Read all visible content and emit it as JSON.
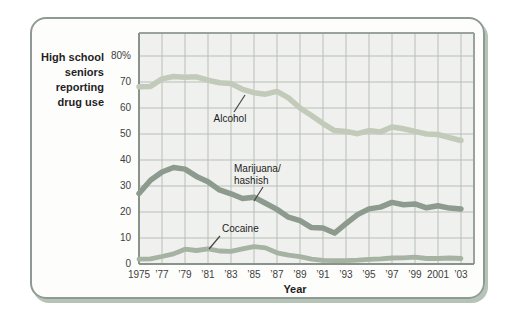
{
  "colors": {
    "card-border": "#8f9a93",
    "shadow": "#b6c3b7",
    "plot-bg": "#f0f1ee",
    "grid": "#b7bfb6",
    "frame": "#9aa39b",
    "axis": "#8a938b",
    "text": "#1f1f1f",
    "text-muted": "#3d3d3d",
    "callout": "#444444"
  },
  "chart_data": {
    "type": "line",
    "title": "High school seniors reporting drug use",
    "title_lines": [
      "High school",
      "seniors",
      "reporting",
      "drug use"
    ],
    "xlabel": "Year",
    "ylabel": "High school seniors reporting drug use",
    "grid": true,
    "legend": "inline annotations with leader lines",
    "xlim": [
      1975,
      2004.2
    ],
    "ylim": [
      0,
      88.8
    ],
    "x": [
      1975,
      1976,
      1977,
      1978,
      1979,
      1980,
      1981,
      1982,
      1983,
      1984,
      1985,
      1986,
      1987,
      1988,
      1989,
      1990,
      1991,
      1992,
      1993,
      1994,
      1995,
      1996,
      1997,
      1998,
      1999,
      2000,
      2001,
      2002,
      2003
    ],
    "x_tick_years": [
      1975,
      1977,
      1979,
      1981,
      1983,
      1985,
      1987,
      1989,
      1991,
      1993,
      1995,
      1997,
      1999,
      2001,
      2003
    ],
    "x_tick_labels": [
      "1975",
      "’77",
      "’79",
      "’81",
      "’83",
      "’85",
      "’87",
      "’89",
      "’91",
      "’93",
      "’95",
      "’97",
      "’99",
      "2001",
      "’03"
    ],
    "y_ticks": [
      0,
      10,
      20,
      30,
      40,
      50,
      60,
      70,
      80
    ],
    "y_tick_labels": [
      "0",
      "10",
      "20",
      "30",
      "40",
      "50",
      "60",
      "70",
      "80%"
    ],
    "series": [
      {
        "name": "Alcohol",
        "color": "#c2cbba",
        "values": [
          68.2,
          68.3,
          71.2,
          72.1,
          71.8,
          72.0,
          70.7,
          69.7,
          69.4,
          67.2,
          65.9,
          65.3,
          66.4,
          63.9,
          60.0,
          57.1,
          54.0,
          51.3,
          51.0,
          50.1,
          51.3,
          50.8,
          52.7,
          52.0,
          51.0,
          50.0,
          49.8,
          48.6,
          47.5
        ]
      },
      {
        "name": "Marijuana/hashish",
        "color": "#8d9a8e",
        "values": [
          27.1,
          32.2,
          35.4,
          37.1,
          36.5,
          33.7,
          31.6,
          28.5,
          27.0,
          25.2,
          25.7,
          23.4,
          21.0,
          18.0,
          16.7,
          14.0,
          13.8,
          11.9,
          15.5,
          19.0,
          21.2,
          21.9,
          23.7,
          22.8,
          23.1,
          21.6,
          22.4,
          21.5,
          21.2
        ]
      },
      {
        "name": "Cocaine",
        "color": "#a6b2a2",
        "values": [
          1.9,
          2.0,
          2.9,
          3.9,
          5.7,
          5.2,
          5.8,
          5.0,
          4.9,
          5.8,
          6.7,
          6.2,
          4.3,
          3.4,
          2.8,
          1.9,
          1.4,
          1.3,
          1.3,
          1.5,
          1.8,
          2.0,
          2.3,
          2.4,
          2.6,
          2.1,
          2.1,
          2.3,
          2.1
        ]
      }
    ],
    "annotations": [
      {
        "series": "Alcohol",
        "line1": "Alcohol"
      },
      {
        "series": "Marijuana/hashish",
        "line1": "Marijuana/",
        "line2": "hashish"
      },
      {
        "series": "Cocaine",
        "line1": "Cocaine"
      }
    ]
  }
}
